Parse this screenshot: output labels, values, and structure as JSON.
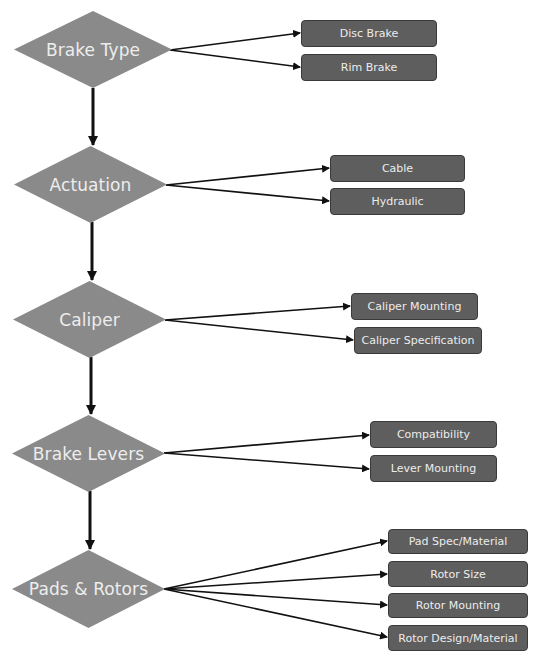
{
  "diagram": {
    "type": "flowchart",
    "colors": {
      "diamond_fill": "#8a8a8a",
      "box_fill": "#5e5e5e",
      "box_border": "#3a3a3a",
      "label_text": "#ececec",
      "connector": "#111111",
      "background": "#ffffff"
    },
    "stages": [
      {
        "label": "Brake Type",
        "options": [
          "Disc Brake",
          "Rim Brake"
        ]
      },
      {
        "label": "Actuation",
        "options": [
          "Cable",
          "Hydraulic"
        ]
      },
      {
        "label": "Caliper",
        "options": [
          "Caliper Mounting",
          "Caliper Specification"
        ]
      },
      {
        "label": "Brake Levers",
        "options": [
          "Compatibility",
          "Lever Mounting"
        ]
      },
      {
        "label": "Pads & Rotors",
        "options": [
          "Pad Spec/Material",
          "Rotor Size",
          "Rotor Mounting",
          "Rotor Design/Material"
        ]
      }
    ]
  }
}
